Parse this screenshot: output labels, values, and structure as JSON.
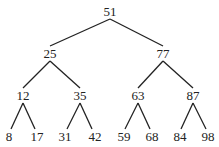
{
  "diagram": {
    "type": "binary-search-tree",
    "colors": {
      "ink": "#222222",
      "background": "#ffffff"
    },
    "nodes": [
      {
        "id": "n51",
        "label": "51",
        "x": 110,
        "y": 16
      },
      {
        "id": "n25",
        "label": "25",
        "x": 50,
        "y": 58
      },
      {
        "id": "n77",
        "label": "77",
        "x": 163,
        "y": 58
      },
      {
        "id": "n12",
        "label": "12",
        "x": 23,
        "y": 100
      },
      {
        "id": "n35",
        "label": "35",
        "x": 80,
        "y": 100
      },
      {
        "id": "n63",
        "label": "63",
        "x": 138,
        "y": 100
      },
      {
        "id": "n87",
        "label": "87",
        "x": 193,
        "y": 100
      },
      {
        "id": "n8",
        "label": "8",
        "x": 9,
        "y": 141
      },
      {
        "id": "n17",
        "label": "17",
        "x": 37,
        "y": 141
      },
      {
        "id": "n31",
        "label": "31",
        "x": 65,
        "y": 141
      },
      {
        "id": "n42",
        "label": "42",
        "x": 95,
        "y": 141
      },
      {
        "id": "n59",
        "label": "59",
        "x": 124,
        "y": 141
      },
      {
        "id": "n68",
        "label": "68",
        "x": 152,
        "y": 141
      },
      {
        "id": "n84",
        "label": "84",
        "x": 180,
        "y": 141
      },
      {
        "id": "n98",
        "label": "98",
        "x": 208,
        "y": 141
      }
    ],
    "edges": [
      {
        "from": "n51",
        "to": "n25",
        "x1": 110,
        "y1": 19,
        "x2": 50,
        "y2": 46
      },
      {
        "from": "n51",
        "to": "n77",
        "x1": 110,
        "y1": 19,
        "x2": 163,
        "y2": 46
      },
      {
        "from": "n25",
        "to": "n12",
        "x1": 50,
        "y1": 61,
        "x2": 23,
        "y2": 88
      },
      {
        "from": "n25",
        "to": "n35",
        "x1": 50,
        "y1": 61,
        "x2": 80,
        "y2": 88
      },
      {
        "from": "n77",
        "to": "n63",
        "x1": 163,
        "y1": 61,
        "x2": 138,
        "y2": 88
      },
      {
        "from": "n77",
        "to": "n87",
        "x1": 163,
        "y1": 61,
        "x2": 193,
        "y2": 88
      },
      {
        "from": "n12",
        "to": "n8",
        "x1": 23,
        "y1": 103,
        "x2": 11,
        "y2": 129
      },
      {
        "from": "n12",
        "to": "n17",
        "x1": 23,
        "y1": 103,
        "x2": 35,
        "y2": 129
      },
      {
        "from": "n35",
        "to": "n31",
        "x1": 80,
        "y1": 103,
        "x2": 67,
        "y2": 129
      },
      {
        "from": "n35",
        "to": "n42",
        "x1": 80,
        "y1": 103,
        "x2": 92,
        "y2": 129
      },
      {
        "from": "n63",
        "to": "n59",
        "x1": 138,
        "y1": 103,
        "x2": 125,
        "y2": 129
      },
      {
        "from": "n63",
        "to": "n68",
        "x1": 138,
        "y1": 103,
        "x2": 150,
        "y2": 129
      },
      {
        "from": "n87",
        "to": "n84",
        "x1": 193,
        "y1": 103,
        "x2": 181,
        "y2": 129
      },
      {
        "from": "n87",
        "to": "n98",
        "x1": 193,
        "y1": 103,
        "x2": 206,
        "y2": 129
      }
    ]
  }
}
